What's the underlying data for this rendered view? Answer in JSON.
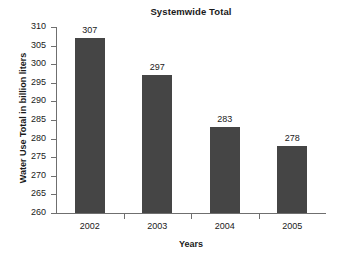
{
  "chart_data": {
    "type": "bar",
    "title": "Systemwide Total",
    "xlabel": "Years",
    "ylabel": "Water Use Total in billion liters",
    "categories": [
      "2002",
      "2003",
      "2004",
      "2005"
    ],
    "values": [
      307,
      297,
      283,
      278
    ],
    "value_labels": [
      "307",
      "297",
      "283",
      "278"
    ],
    "ylim": [
      260,
      310
    ],
    "ytick_step": 5,
    "yticks": [
      310,
      305,
      300,
      295,
      290,
      285,
      280,
      275,
      270,
      265,
      260
    ],
    "ytick_labels": [
      "310",
      "305",
      "300",
      "295",
      "290",
      "285",
      "280",
      "275",
      "270",
      "265",
      "260"
    ],
    "grid": false,
    "legend": false,
    "bar_color": "#454545",
    "axis_color": "#6f6f6f",
    "text_color": "#1a1a1a",
    "background": "#ffffff"
  }
}
